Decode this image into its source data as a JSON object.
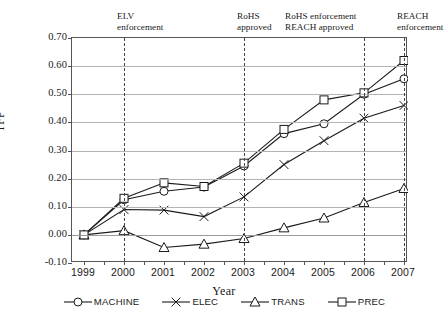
{
  "chart_data": {
    "type": "line",
    "title": "",
    "xlabel": "Year",
    "ylabel": "TFP",
    "categories": [
      "1999",
      "2000",
      "2001",
      "2002",
      "2003",
      "2004",
      "2005",
      "2006",
      "2007"
    ],
    "ylim": [
      -0.1,
      0.7
    ],
    "yticks": [
      "0.70",
      "0.60",
      "0.50",
      "0.40",
      "0.30",
      "0.20",
      "0.10",
      "0.00",
      "-0.10"
    ],
    "ytick_values": [
      0.7,
      0.6,
      0.5,
      0.4,
      0.3,
      0.2,
      0.1,
      0.0,
      -0.1
    ],
    "grid": true,
    "legend_position": "bottom",
    "series": [
      {
        "name": "MACHINE",
        "marker": "circle",
        "values": [
          0.0,
          0.125,
          0.155,
          0.17,
          0.245,
          0.36,
          0.395,
          0.5,
          0.555
        ]
      },
      {
        "name": "ELEC",
        "marker": "x",
        "values": [
          0.0,
          0.09,
          0.088,
          0.065,
          0.135,
          0.25,
          0.335,
          0.415,
          0.46
        ]
      },
      {
        "name": "TRANS",
        "marker": "triangle",
        "values": [
          0.0,
          0.015,
          -0.045,
          -0.033,
          -0.013,
          0.025,
          0.06,
          0.115,
          0.165
        ]
      },
      {
        "name": "PREC",
        "marker": "square",
        "values": [
          0.0,
          0.13,
          0.185,
          0.172,
          0.255,
          0.375,
          0.48,
          0.505,
          0.62
        ]
      }
    ],
    "annotations": [
      {
        "at": "2000",
        "text": "ELV\nenforcement"
      },
      {
        "at": "2003",
        "text": "RoHS\napproved"
      },
      {
        "at": "2006",
        "text": "RoHS enforcement\nREACH approved"
      },
      {
        "at": "2007",
        "text": "REACH\nenforcement"
      }
    ],
    "colors": {
      "line": "#1a1a1a",
      "grid": "#b4b4b4",
      "axis": "#555555",
      "event": "#444444"
    }
  }
}
